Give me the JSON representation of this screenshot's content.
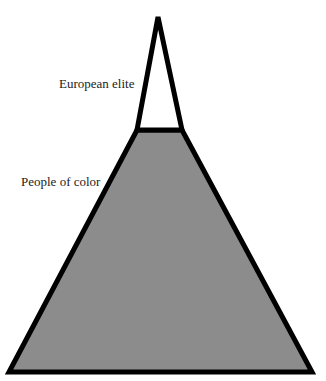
{
  "diagram": {
    "type": "pyramid",
    "layers": [
      {
        "name": "top",
        "label": "European elite",
        "fill": "#ffffff",
        "stroke": "#000000"
      },
      {
        "name": "base",
        "label": "People of color",
        "fill": "#8c8c8c",
        "stroke": "#000000"
      }
    ]
  }
}
